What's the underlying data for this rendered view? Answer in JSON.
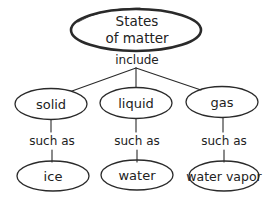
{
  "diagram": {
    "type": "concept-map",
    "root": {
      "line1": "States",
      "line2": "of matter"
    },
    "root_link": "include",
    "branches": [
      {
        "category": "solid",
        "link": "such as",
        "example": "ice"
      },
      {
        "category": "liquid",
        "link": "such as",
        "example": "water"
      },
      {
        "category": "gas",
        "link": "such as",
        "example": "water vapor"
      }
    ]
  }
}
